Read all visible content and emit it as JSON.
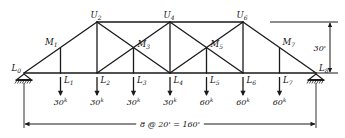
{
  "figure": {
    "span_label": "8 @ 20' = 160'",
    "height_label": "30'",
    "ink_color": "#1a1a1a"
  },
  "nodes": {
    "bottom_chord": [
      {
        "id": "L0",
        "base": "L",
        "sub": "0",
        "x": 0
      },
      {
        "id": "L1",
        "base": "L",
        "sub": "1",
        "x": 20
      },
      {
        "id": "L2",
        "base": "L",
        "sub": "2",
        "x": 40
      },
      {
        "id": "L3",
        "base": "L",
        "sub": "3",
        "x": 60
      },
      {
        "id": "L4",
        "base": "L",
        "sub": "4",
        "x": 80
      },
      {
        "id": "L5",
        "base": "L",
        "sub": "5",
        "x": 100
      },
      {
        "id": "L6",
        "base": "L",
        "sub": "6",
        "x": 120
      },
      {
        "id": "L7",
        "base": "L",
        "sub": "7",
        "x": 140
      },
      {
        "id": "L8",
        "base": "L",
        "sub": "8",
        "x": 160
      }
    ],
    "mid_chord": [
      {
        "id": "M1",
        "base": "M",
        "sub": "1",
        "x": 20
      },
      {
        "id": "M3",
        "base": "M",
        "sub": "3",
        "x": 60
      },
      {
        "id": "M5",
        "base": "M",
        "sub": "5",
        "x": 100
      },
      {
        "id": "M7",
        "base": "M",
        "sub": "7",
        "x": 140
      }
    ],
    "top_chord": [
      {
        "id": "U2",
        "base": "U",
        "sub": "2",
        "x": 40
      },
      {
        "id": "U4",
        "base": "U",
        "sub": "4",
        "x": 80
      },
      {
        "id": "U6",
        "base": "U",
        "sub": "6",
        "x": 120
      }
    ]
  },
  "loads": [
    {
      "node": "L1",
      "value": "30",
      "unit": "k"
    },
    {
      "node": "L2",
      "value": "30",
      "unit": "k"
    },
    {
      "node": "L3",
      "value": "30",
      "unit": "k"
    },
    {
      "node": "L4",
      "value": "30",
      "unit": "k"
    },
    {
      "node": "L5",
      "value": "60",
      "unit": "k"
    },
    {
      "node": "L6",
      "value": "60",
      "unit": "k"
    },
    {
      "node": "L7",
      "value": "60",
      "unit": "k"
    }
  ],
  "supports": [
    {
      "node": "L0",
      "type": "pinned-support"
    },
    {
      "node": "L8",
      "type": "roller-support"
    }
  ]
}
